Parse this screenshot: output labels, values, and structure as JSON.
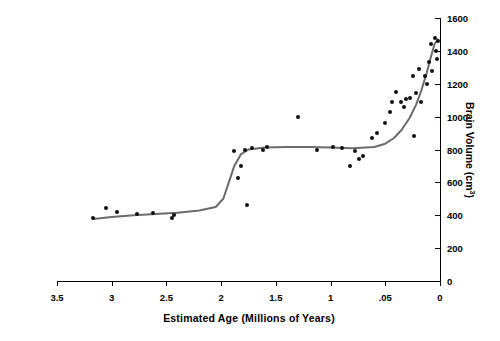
{
  "chart_data": {
    "type": "scatter",
    "title": "",
    "xlabel": "Estimated Age (Millions of Years)",
    "ylabel": "Brain Volume (cm³)",
    "xlim": [
      3.5,
      0
    ],
    "ylim": [
      0,
      1600
    ],
    "x_ticks": [
      "3.5",
      "3",
      "2.5",
      "2",
      "1.5",
      "1",
      ".05",
      "0"
    ],
    "x_tick_values": [
      3.5,
      3.0,
      2.5,
      2.0,
      1.5,
      1.0,
      0.5,
      0.0
    ],
    "y_ticks": [
      "0",
      "200",
      "400",
      "600",
      "800",
      "1000",
      "1200",
      "1400",
      "1600"
    ],
    "y_tick_values": [
      0,
      200,
      400,
      600,
      800,
      1000,
      1200,
      1400,
      1600
    ],
    "grid": false,
    "legend": null,
    "series": [
      {
        "name": "Hominin cranial capacity",
        "marker": "filled-circle",
        "color": "#111111",
        "points": [
          [
            3.17,
            385
          ],
          [
            3.05,
            445
          ],
          [
            2.95,
            420
          ],
          [
            2.77,
            410
          ],
          [
            2.62,
            415
          ],
          [
            2.45,
            385
          ],
          [
            2.43,
            400
          ],
          [
            1.88,
            790
          ],
          [
            1.85,
            625
          ],
          [
            1.82,
            700
          ],
          [
            1.78,
            800
          ],
          [
            1.76,
            460
          ],
          [
            1.72,
            810
          ],
          [
            1.62,
            800
          ],
          [
            1.58,
            815
          ],
          [
            1.3,
            995
          ],
          [
            1.12,
            800
          ],
          [
            0.98,
            815
          ],
          [
            0.9,
            810
          ],
          [
            0.82,
            700
          ],
          [
            0.78,
            790
          ],
          [
            0.74,
            745
          ],
          [
            0.7,
            760
          ],
          [
            0.62,
            870
          ],
          [
            0.58,
            900
          ],
          [
            0.5,
            960
          ],
          [
            0.46,
            1030
          ],
          [
            0.44,
            1090
          ],
          [
            0.4,
            1150
          ],
          [
            0.36,
            1090
          ],
          [
            0.33,
            1060
          ],
          [
            0.31,
            1105
          ],
          [
            0.27,
            1115
          ],
          [
            0.25,
            1250
          ],
          [
            0.24,
            880
          ],
          [
            0.22,
            1145
          ],
          [
            0.19,
            1290
          ],
          [
            0.17,
            1090
          ],
          [
            0.14,
            1250
          ],
          [
            0.12,
            1200
          ],
          [
            0.1,
            1330
          ],
          [
            0.08,
            1440
          ],
          [
            0.07,
            1280
          ],
          [
            0.05,
            1480
          ],
          [
            0.04,
            1400
          ],
          [
            0.03,
            1350
          ],
          [
            0.02,
            1460
          ]
        ]
      }
    ],
    "fit_curve": {
      "name": "trend-line",
      "color": "#6b6b6b",
      "points": [
        [
          3.17,
          378
        ],
        [
          3.0,
          390
        ],
        [
          2.8,
          400
        ],
        [
          2.6,
          408
        ],
        [
          2.4,
          415
        ],
        [
          2.2,
          428
        ],
        [
          2.05,
          450
        ],
        [
          1.98,
          500
        ],
        [
          1.93,
          600
        ],
        [
          1.88,
          700
        ],
        [
          1.82,
          770
        ],
        [
          1.75,
          800
        ],
        [
          1.6,
          812
        ],
        [
          1.4,
          815
        ],
        [
          1.2,
          815
        ],
        [
          1.0,
          812
        ],
        [
          0.8,
          808
        ],
        [
          0.6,
          815
        ],
        [
          0.5,
          835
        ],
        [
          0.42,
          870
        ],
        [
          0.35,
          920
        ],
        [
          0.28,
          990
        ],
        [
          0.22,
          1070
        ],
        [
          0.17,
          1160
        ],
        [
          0.12,
          1270
        ],
        [
          0.08,
          1370
        ],
        [
          0.05,
          1440
        ],
        [
          0.02,
          1470
        ]
      ]
    }
  }
}
